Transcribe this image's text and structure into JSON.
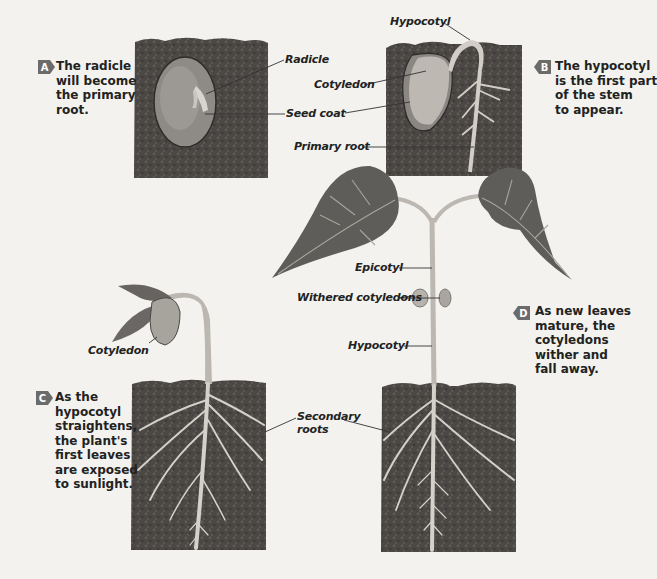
{
  "colors": {
    "background": "#f3f2ee",
    "soil": "#4a4643",
    "soil_light": "#5c5855",
    "leaf": "#5e5c59",
    "leaf_vein": "#a8a59f",
    "stem": "#b8b5ae",
    "root": "#cfccc6",
    "seed": "#8f8b86",
    "badge": "#6b6b6b",
    "text": "#222222"
  },
  "stages": [
    {
      "id": "A",
      "badge": "A",
      "caption_lines": [
        "The radicle",
        "will become",
        "the primary",
        "root."
      ],
      "labels": [
        "Radicle",
        "Seed coat"
      ]
    },
    {
      "id": "B",
      "badge": "B",
      "caption_lines": [
        "The hypocotyl",
        "is the first part",
        "of the stem",
        "to appear."
      ],
      "labels": [
        "Hypocotyl",
        "Cotyledon",
        "Primary root"
      ]
    },
    {
      "id": "C",
      "badge": "C",
      "caption_lines": [
        "As the",
        "hypocotyl",
        "straightens,",
        "the plant's",
        "first leaves",
        "are exposed",
        "to sunlight."
      ],
      "labels": [
        "Cotyledon",
        "Secondary roots"
      ]
    },
    {
      "id": "D",
      "badge": "D",
      "caption_lines": [
        "As new leaves",
        "mature, the",
        "cotyledons",
        "wither and",
        "fall away."
      ],
      "labels": [
        "Epicotyl",
        "Withered cotyledons",
        "Hypocotyl"
      ]
    }
  ],
  "labels": {
    "radicle": "Radicle",
    "cotyledon_b": "Cotyledon",
    "seed_coat": "Seed coat",
    "hypocotyl_b": "Hypocotyl",
    "primary_root": "Primary root",
    "epicotyl": "Epicotyl",
    "withered_cotyledons": "Withered cotyledons",
    "hypocotyl_d": "Hypocotyl",
    "cotyledon_c": "Cotyledon",
    "secondary_line1": "Secondary",
    "secondary_line2": "roots"
  }
}
